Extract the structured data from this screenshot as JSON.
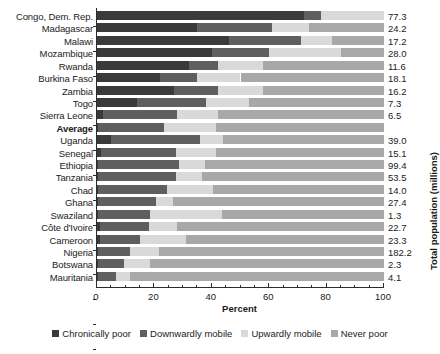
{
  "chart_data": {
    "type": "bar",
    "subtype": "stacked-horizontal-100pct",
    "title": "",
    "xlabel": "Percent",
    "ylabel": "",
    "secondary_axis_label": "Total population (millions)",
    "xlim": [
      0,
      100
    ],
    "xticks": [
      0,
      20,
      40,
      60,
      80,
      100
    ],
    "xtick_labels": [
      "0",
      "20",
      "40",
      "60",
      "80",
      "100"
    ],
    "minor_tick_step": 5,
    "grid": false,
    "legend_position": "bottom",
    "orientation": "horizontal",
    "categories": [
      "Congo, Dem. Rep.",
      "Madagascar",
      "Malawi",
      "Mozambique",
      "Rwanda",
      "Burkina Faso",
      "Zambia",
      "Togo",
      "Sierra Leone",
      "Average",
      "Uganda",
      "Senegal",
      "Ethiopia",
      "Tanzania",
      "Chad",
      "Ghana",
      "Swaziland",
      "Côte d'Ivoire",
      "Cameroon",
      "Nigeria",
      "Botswana",
      "Mauritania"
    ],
    "emphasized_category": "Average",
    "series": [
      {
        "name": "Chronically poor",
        "color": "#3a3a3a",
        "values": [
          72.0,
          35.0,
          46.0,
          40.0,
          32.0,
          22.0,
          27.0,
          14.0,
          2.0,
          0.5,
          5.0,
          1.5,
          0.5,
          0.5,
          0.5,
          0.5,
          0.5,
          1.0,
          1.0,
          0.5,
          0.5,
          0.5
        ]
      },
      {
        "name": "Downwardly mobile",
        "color": "#5f5f5f",
        "values": [
          6.0,
          26.0,
          25.0,
          20.0,
          10.0,
          13.0,
          15.0,
          24.0,
          26.0,
          23.0,
          31.0,
          26.0,
          28.0,
          27.0,
          24.0,
          20.0,
          18.0,
          17.0,
          14.0,
          11.0,
          9.0,
          6.0
        ]
      },
      {
        "name": "Upwardly mobile",
        "color": "#d9d9d9",
        "values": [
          22.0,
          13.0,
          11.0,
          25.0,
          16.0,
          15.0,
          16.0,
          15.0,
          14.0,
          18.0,
          8.0,
          14.0,
          9.0,
          9.0,
          16.0,
          6.0,
          25.0,
          10.0,
          16.0,
          10.0,
          9.0,
          5.0
        ]
      },
      {
        "name": "Never poor",
        "color": "#a8a8a8",
        "values": [
          0.0,
          26.0,
          18.0,
          15.0,
          42.0,
          50.0,
          42.0,
          47.0,
          58.0,
          58.5,
          56.0,
          58.5,
          62.5,
          63.5,
          59.5,
          73.5,
          56.5,
          72.0,
          69.0,
          78.5,
          81.5,
          88.5
        ]
      }
    ],
    "population_header": "",
    "population_values": [
      "77.3",
      "24.2",
      "17.2",
      "28.0",
      "11.6",
      "18.1",
      "16.2",
      "7.3",
      "6.5",
      "",
      "39.0",
      "15.1",
      "99.4",
      "53.5",
      "14.0",
      "27.4",
      "1.3",
      "22.7",
      "23.3",
      "182.2",
      "2.3",
      "4.1"
    ]
  },
  "legend": {
    "items": [
      {
        "label": "Chronically poor",
        "color": "#3a3a3a"
      },
      {
        "label": "Downwardly mobile",
        "color": "#5f5f5f"
      },
      {
        "label": "Upwardly mobile",
        "color": "#d9d9d9"
      },
      {
        "label": "Never poor",
        "color": "#a8a8a8"
      }
    ]
  },
  "axes": {
    "x_title": "Percent",
    "y_right_title": "Total population (millions)"
  }
}
